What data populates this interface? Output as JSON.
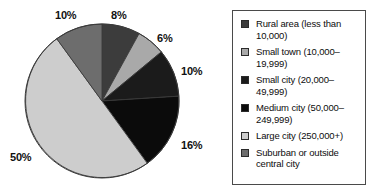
{
  "chart_data": {
    "type": "pie",
    "title": "",
    "subtitle": "",
    "xlabel": "",
    "ylabel": "",
    "grid": false,
    "legend_position": "right",
    "start_angle_deg": 0,
    "direction": "clockwise",
    "categories": [
      "Rural area (less than 10,000)",
      "Small town (10,000–19,999)",
      "Small city (20,000–49,999)",
      "Medium city (50,000–249,999)",
      "Large city (250,000+)",
      "Suburban or outside central city"
    ],
    "values": [
      8,
      6,
      10,
      16,
      50,
      10
    ],
    "value_labels": [
      "8%",
      "6%",
      "10%",
      "16%",
      "50%",
      "10%"
    ],
    "colors": [
      "#3c3c3c",
      "#a9a9a9",
      "#1b1b1b",
      "#0b0b0b",
      "#cdcdcd",
      "#6d6d6d"
    ],
    "units": "percent"
  },
  "pie": {
    "center_x": 102,
    "center_y": 101,
    "radius": 77,
    "outline_color": "#3a3a3a",
    "labels": [
      {
        "text": "8%",
        "x": 111,
        "y": 10,
        "name": "pie-label-rural-area"
      },
      {
        "text": "6%",
        "x": 157,
        "y": 33,
        "name": "pie-label-small-town"
      },
      {
        "text": "10%",
        "x": 181,
        "y": 66,
        "name": "pie-label-small-city"
      },
      {
        "text": "16%",
        "x": 181,
        "y": 140,
        "name": "pie-label-medium-city"
      },
      {
        "text": "50%",
        "x": 10,
        "y": 152,
        "name": "pie-label-large-city"
      },
      {
        "text": "10%",
        "x": 55,
        "y": 10,
        "name": "pie-label-suburban"
      }
    ]
  },
  "legend": {
    "items": [
      {
        "label": "Rural area (less than 10,000)",
        "color": "#3c3c3c",
        "name": "legend-item-rural-area"
      },
      {
        "label": "Small town (10,000–19,999)",
        "color": "#a9a9a9",
        "name": "legend-item-small-town"
      },
      {
        "label": "Small city (20,000–49,999)",
        "color": "#1b1b1b",
        "name": "legend-item-small-city"
      },
      {
        "label": "Medium city (50,000–249,999)",
        "color": "#0b0b0b",
        "name": "legend-item-medium-city"
      },
      {
        "label": "Large city (250,000+)",
        "color": "#cdcdcd",
        "name": "legend-item-large-city"
      },
      {
        "label": "Suburban or outside central city",
        "color": "#6d6d6d",
        "name": "legend-item-suburban"
      }
    ]
  }
}
